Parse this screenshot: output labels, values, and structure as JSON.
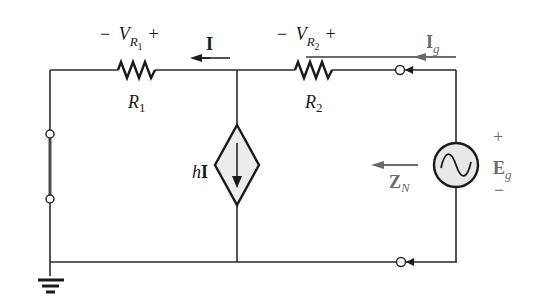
{
  "diagram": {
    "type": "circuit-schematic",
    "labels": {
      "vr1_minus": "−",
      "vr1_V": "V",
      "vr1_sub": "R",
      "vr1_subsub": "1",
      "vr1_plus": "+",
      "r1_R": "R",
      "r1_sub": "1",
      "current_I": "I",
      "vr2_minus": "−",
      "vr2_V": "V",
      "vr2_sub": "R",
      "vr2_subsub": "2",
      "vr2_plus": "+",
      "r2_R": "R",
      "r2_sub": "2",
      "ig_I": "I",
      "ig_sub": "g",
      "dep_h": "h",
      "dep_I": "I",
      "zn_Z": "Z",
      "zn_sub": "N",
      "eg_plus": "+",
      "eg_E": "E",
      "eg_sub": "g",
      "eg_minus": "−"
    },
    "components": [
      {
        "id": "R1",
        "kind": "resistor"
      },
      {
        "id": "R2",
        "kind": "resistor"
      },
      {
        "id": "hI",
        "kind": "dependent-current-source",
        "direction": "down"
      },
      {
        "id": "Eg",
        "kind": "ac-voltage-source"
      },
      {
        "id": "ground",
        "kind": "ground"
      },
      {
        "id": "short",
        "kind": "short-circuit-between-terminals"
      }
    ],
    "colors": {
      "wire": "#2a2a2a",
      "source_fill": "#e6e6e6",
      "annotation_grey": "#6a6a6a"
    }
  }
}
